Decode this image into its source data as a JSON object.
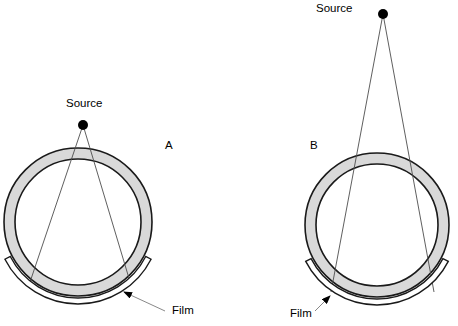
{
  "figure": {
    "background_color": "#ffffff",
    "width": 458,
    "height": 326
  },
  "style": {
    "wall_fill_color": "#d9d9d9",
    "outline_color": "#1a1a1a",
    "ray_color": "#4d4d4d",
    "source_dot_color": "#000000",
    "leader_color": "#7a7a7a",
    "text_color": "#000000"
  },
  "panels": [
    {
      "id": "A",
      "panel_label": "A",
      "panel_label_pos": {
        "x": 165,
        "y": 149
      },
      "source_label": "Source",
      "source_label_pos": {
        "x": 66,
        "y": 107
      },
      "source_dot": {
        "x": 83,
        "y": 125,
        "r": 5
      },
      "pipe": {
        "center": {
          "x": 78,
          "y": 222
        },
        "outer_radius": 74,
        "inner_radius": 63
      },
      "film": {
        "label": "Film",
        "label_pos": {
          "x": 172,
          "y": 314
        },
        "arc_center": {
          "x": 78,
          "y": 222
        },
        "arc_inner_radius": 76,
        "arc_outer_radius": 82,
        "arc_start_deg": 27,
        "arc_end_deg": 153,
        "arrow_tip": {
          "x": 124,
          "y": 292
        },
        "leader_from": {
          "x": 165,
          "y": 311
        }
      },
      "rays": [
        {
          "x1": 83,
          "y1": 125,
          "x2": 29,
          "y2": 285
        },
        {
          "x1": 83,
          "y1": 125,
          "x2": 131,
          "y2": 285
        }
      ]
    },
    {
      "id": "B",
      "panel_label": "B",
      "panel_label_pos": {
        "x": 310,
        "y": 149
      },
      "source_label": "Source",
      "source_label_pos": {
        "x": 316,
        "y": 12
      },
      "source_dot": {
        "x": 383,
        "y": 14,
        "r": 5
      },
      "pipe": {
        "center": {
          "x": 377,
          "y": 225
        },
        "outer_radius": 72,
        "inner_radius": 61
      },
      "film": {
        "label": "Film",
        "label_pos": {
          "x": 290,
          "y": 317
        },
        "arc_center": {
          "x": 377,
          "y": 225
        },
        "arc_inner_radius": 74,
        "arc_outer_radius": 80,
        "arc_start_deg": 27,
        "arc_end_deg": 153,
        "arrow_tip": {
          "x": 330,
          "y": 296
        },
        "leader_from": {
          "x": 315,
          "y": 311
        }
      },
      "rays": [
        {
          "x1": 383,
          "y1": 14,
          "x2": 331,
          "y2": 292
        },
        {
          "x1": 383,
          "y1": 14,
          "x2": 434,
          "y2": 292
        }
      ]
    }
  ]
}
